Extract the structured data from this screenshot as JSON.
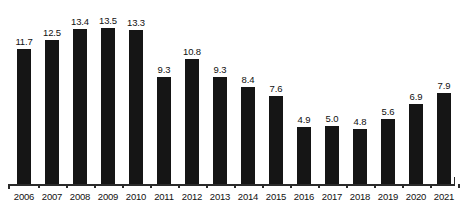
{
  "chart_data": {
    "type": "bar",
    "title": "",
    "subtitle": "",
    "xlabel": "",
    "ylabel": "",
    "categories": [
      "2006",
      "2007",
      "2008",
      "2009",
      "2010",
      "2011",
      "2012",
      "2013",
      "2014",
      "2015",
      "2016",
      "2017",
      "2018",
      "2019",
      "2020",
      "2021"
    ],
    "values": [
      11.7,
      12.5,
      13.4,
      13.5,
      13.3,
      9.3,
      10.8,
      9.3,
      8.4,
      7.6,
      4.9,
      5.0,
      4.8,
      5.6,
      6.9,
      7.9
    ],
    "value_labels": [
      "11.7",
      "12.5",
      "13.4",
      "13.5",
      "13.3",
      "9.3",
      "10.8",
      "9.3",
      "8.4",
      "7.6",
      "4.9",
      "5.0",
      "4.8",
      "5.6",
      "6.9",
      "7.9"
    ],
    "ylim": [
      0,
      13.5
    ],
    "grid": false,
    "legend": null,
    "legend_position": "none",
    "y_axis_visible": false,
    "x_axis_visible": true,
    "data_labels_shown": true,
    "bar_color": "#151515",
    "axis_color": "#2a2a2a",
    "label_color": "#111111",
    "background_color": "#ffffff",
    "annotations": []
  }
}
